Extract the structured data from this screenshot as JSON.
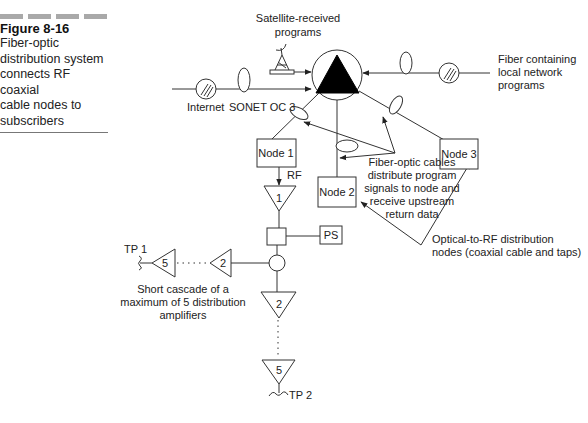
{
  "figure": {
    "number": "Figure 8-16",
    "caption_lines": [
      "Fiber-optic",
      "distribution system",
      "connects RF coaxial",
      "cable nodes to",
      "subscribers"
    ]
  },
  "labels": {
    "satellite": [
      "Satellite-received",
      "programs"
    ],
    "internet": "Internet",
    "sonet": "SONET OC 3",
    "local_fiber": [
      "Fiber containing",
      "local network",
      "programs"
    ],
    "fiber_cables": [
      "Fiber-optic cables",
      "distribute program",
      "signals to node and",
      "receive upstream",
      "return data"
    ],
    "optical_rf": [
      "Optical-to-RF distribution",
      "nodes (coaxial cable and taps)"
    ],
    "cascade": [
      "Short cascade of a",
      "maximum of 5 distribution",
      "amplifiers"
    ],
    "rf": "RF",
    "ps": "PS",
    "tp1": "TP 1",
    "tp2": "TP 2"
  },
  "nodes": [
    {
      "id": "node1",
      "label": "Node 1"
    },
    {
      "id": "node2",
      "label": "Node 2"
    },
    {
      "id": "node3",
      "label": "Node 3"
    }
  ],
  "amplifiers": {
    "first": "1",
    "left_2": "2",
    "left_5": "5",
    "down_2": "2",
    "down_5": "5"
  }
}
